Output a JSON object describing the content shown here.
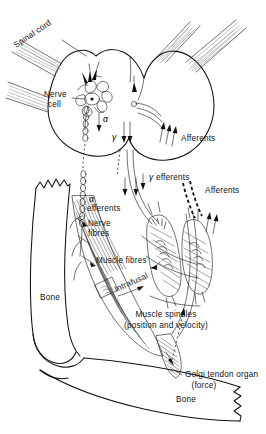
{
  "figure": {
    "ink_color": "#111111",
    "background_color": "#ffffff",
    "shading_color": "#8d8d8d"
  },
  "labels": {
    "spinal_cord": "Spinal cord",
    "nerve_cell_line1": "Nerve",
    "nerve_cell_line2": "cell",
    "alpha_symbol": "α",
    "gamma_symbol": "γ",
    "afferents_top": "Afferents",
    "gamma_efferents": "efferents",
    "gamma_efferents_symbol": "γ",
    "afferents_mid": "Afferents",
    "alpha_efferents_symbol": "α",
    "alpha_efferents_word": "efferents",
    "nerve_fibres_line1": "Nerve",
    "nerve_fibres_line2": "fibres",
    "muscle_fibres": "Muscle fibres",
    "intrafusal": "Intrafusal",
    "muscle_spindles_line1": "Muscle  spindles",
    "muscle_spindles_line2": "(position and velocity)",
    "bone_left": "Bone",
    "bone_right": "Bone",
    "golgi_line1": "Golgi tendon organ",
    "golgi_line2": "(force)"
  }
}
